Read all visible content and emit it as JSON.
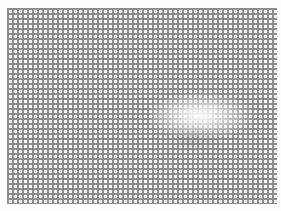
{
  "image": {
    "description": "Photograph of a fine gray square grid mesh on white background with a bright glare highlight",
    "grid": {
      "line_color": "#8c8c8c",
      "background_color": "#f4f4f4",
      "pitch_px": 5
    },
    "glare": {
      "color": "#ffffff"
    }
  }
}
